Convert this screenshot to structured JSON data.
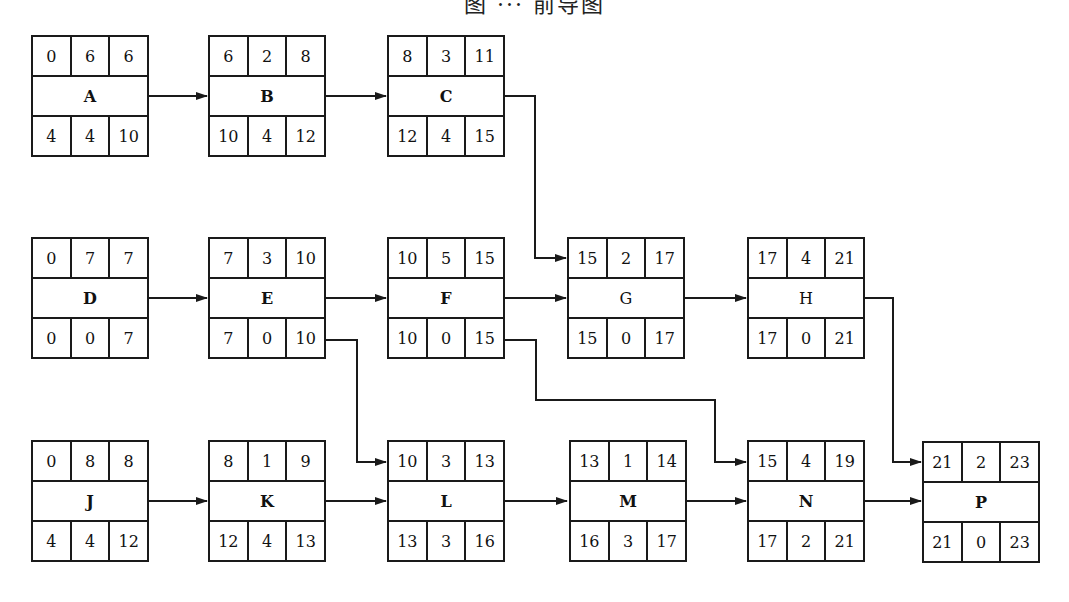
{
  "caption": "图 ··· 前导图",
  "legend": {
    "top_row": [
      "ES",
      "D",
      "EF"
    ],
    "bottom_row": [
      "LS",
      "TF",
      "LF"
    ]
  },
  "nodes": [
    {
      "id": "A",
      "name": "A",
      "col": 0,
      "row": 0,
      "top": [
        "0",
        "6",
        "6"
      ],
      "bottom": [
        "4",
        "4",
        "10"
      ]
    },
    {
      "id": "B",
      "name": "B",
      "col": 1,
      "row": 0,
      "top": [
        "6",
        "2",
        "8"
      ],
      "bottom": [
        "10",
        "4",
        "12"
      ]
    },
    {
      "id": "C",
      "name": "C",
      "col": 2,
      "row": 0,
      "top": [
        "8",
        "3",
        "11"
      ],
      "bottom": [
        "12",
        "4",
        "15"
      ]
    },
    {
      "id": "D",
      "name": "D",
      "col": 0,
      "row": 1,
      "top": [
        "0",
        "7",
        "7"
      ],
      "bottom": [
        "0",
        "0",
        "7"
      ]
    },
    {
      "id": "E",
      "name": "E",
      "col": 1,
      "row": 1,
      "top": [
        "7",
        "3",
        "10"
      ],
      "bottom": [
        "7",
        "0",
        "10"
      ]
    },
    {
      "id": "F",
      "name": "F",
      "col": 2,
      "row": 1,
      "top": [
        "10",
        "5",
        "15"
      ],
      "bottom": [
        "10",
        "0",
        "15"
      ]
    },
    {
      "id": "G",
      "name": "G",
      "col": 3,
      "row": 1,
      "top": [
        "15",
        "2",
        "17"
      ],
      "bottom": [
        "15",
        "0",
        "17"
      ]
    },
    {
      "id": "H",
      "name": "H",
      "col": 4,
      "row": 1,
      "top": [
        "17",
        "4",
        "21"
      ],
      "bottom": [
        "17",
        "0",
        "21"
      ]
    },
    {
      "id": "J",
      "name": "J",
      "col": 0,
      "row": 2,
      "top": [
        "0",
        "8",
        "8"
      ],
      "bottom": [
        "4",
        "4",
        "12"
      ]
    },
    {
      "id": "K",
      "name": "K",
      "col": 1,
      "row": 2,
      "top": [
        "8",
        "1",
        "9"
      ],
      "bottom": [
        "12",
        "4",
        "13"
      ]
    },
    {
      "id": "L",
      "name": "L",
      "col": 2,
      "row": 2,
      "top": [
        "10",
        "3",
        "13"
      ],
      "bottom": [
        "13",
        "3",
        "16"
      ]
    },
    {
      "id": "M",
      "name": "M",
      "col": 3,
      "row": 2,
      "top": [
        "13",
        "1",
        "14"
      ],
      "bottom": [
        "16",
        "3",
        "17"
      ]
    },
    {
      "id": "N",
      "name": "N",
      "col": 4,
      "row": 2,
      "top": [
        "15",
        "4",
        "19"
      ],
      "bottom": [
        "17",
        "2",
        "21"
      ]
    },
    {
      "id": "P",
      "name": "P",
      "col": 5,
      "row": 2,
      "top": [
        "21",
        "2",
        "23"
      ],
      "bottom": [
        "21",
        "0",
        "23"
      ]
    }
  ],
  "edges": [
    {
      "from": "A",
      "to": "B",
      "type": "straight"
    },
    {
      "from": "B",
      "to": "C",
      "type": "straight"
    },
    {
      "from": "C",
      "to": "G",
      "type": "elbow"
    },
    {
      "from": "D",
      "to": "E",
      "type": "straight"
    },
    {
      "from": "E",
      "to": "F",
      "type": "straight"
    },
    {
      "from": "F",
      "to": "G",
      "type": "straight"
    },
    {
      "from": "G",
      "to": "H",
      "type": "straight"
    },
    {
      "from": "E",
      "to": "L",
      "type": "elbow"
    },
    {
      "from": "F",
      "to": "N",
      "type": "elbow"
    },
    {
      "from": "H",
      "to": "P",
      "type": "elbow"
    },
    {
      "from": "J",
      "to": "K",
      "type": "straight"
    },
    {
      "from": "K",
      "to": "L",
      "type": "straight"
    },
    {
      "from": "L",
      "to": "M",
      "type": "straight"
    },
    {
      "from": "M",
      "to": "N",
      "type": "straight"
    },
    {
      "from": "N",
      "to": "P",
      "type": "straight"
    }
  ],
  "colors": {
    "line": "#1a1a1a",
    "background": "#ffffff"
  }
}
